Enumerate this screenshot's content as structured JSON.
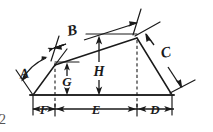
{
  "document": {
    "kind": "engineering-dimension-drawing",
    "page_number": "2",
    "background_color": "#ffffff",
    "line_color": "#1a1a1a"
  },
  "drawing": {
    "title": "Dimensioned trapezoidal profile",
    "shape": {
      "name": "irregular-trapezoid",
      "vertices": [
        {
          "id": "bottom-left",
          "x": 33,
          "y": 95
        },
        {
          "id": "upper-left-break",
          "x": 55,
          "y": 65
        },
        {
          "id": "top-right-apex",
          "x": 137,
          "y": 38
        },
        {
          "id": "bottom-right",
          "x": 172,
          "y": 95
        }
      ]
    },
    "dimensions": [
      {
        "id": "A",
        "label": "A",
        "kind": "angle",
        "description": "angle between left slope and upper slope",
        "label_x": 25,
        "label_y": 78
      },
      {
        "id": "B",
        "label": "B",
        "kind": "linear-oblique",
        "description": "length along upper slope",
        "label_x": 73,
        "label_y": 34
      },
      {
        "id": "C",
        "label": "C",
        "kind": "linear-oblique",
        "description": "length along right slope",
        "label_x": 168,
        "label_y": 55
      },
      {
        "id": "D",
        "label": "D",
        "kind": "linear-horizontal",
        "description": "horizontal run of right slope",
        "label_x": 155,
        "label_y": 115
      },
      {
        "id": "E",
        "label": "E",
        "kind": "linear-horizontal",
        "description": "horizontal span between break point and apex",
        "label_x": 98,
        "label_y": 115
      },
      {
        "id": "F",
        "label": "F",
        "kind": "linear-horizontal",
        "description": "horizontal run of left slope",
        "label_x": 44,
        "label_y": 113
      },
      {
        "id": "G",
        "label": "G",
        "kind": "linear-vertical",
        "description": "height at left break point",
        "label_x": 64,
        "label_y": 85
      },
      {
        "id": "H",
        "label": "H",
        "kind": "linear-vertical",
        "description": "overall height at apex",
        "label_x": 98,
        "label_y": 72
      }
    ]
  }
}
